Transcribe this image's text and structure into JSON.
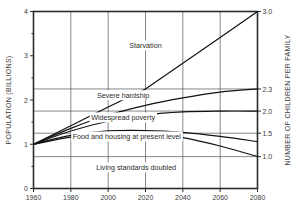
{
  "chart_data": {
    "type": "line",
    "title": "",
    "xlabel": "",
    "ylabel": "POPULATION (BILLIONS)",
    "y2label": "NUMBER OF CHILDREN PER FAMILY",
    "grid": true,
    "legend": "none (inline annotations)",
    "xlim": [
      1960,
      2080
    ],
    "ylim": [
      0,
      4
    ],
    "xticks": [
      1960,
      1980,
      2000,
      2020,
      2040,
      2060,
      2080
    ],
    "xticklabels": [
      "1960",
      "1980",
      "2000",
      "2020",
      "2040",
      "2060",
      "2080"
    ],
    "yticks": [
      0,
      1,
      2,
      3,
      4
    ],
    "yticklabels": [
      "0",
      "1",
      "2",
      "3",
      "4"
    ],
    "y2ticks": [
      3.0,
      2.3,
      2.0,
      1.5,
      1.0
    ],
    "y2ticklabels": [
      "3.0",
      "2.3",
      "2.0",
      "1.5",
      "1.0"
    ],
    "y2_population_positions": [
      4.0,
      2.25,
      1.75,
      1.25,
      0.72
    ],
    "gridline_values": [
      2.25,
      1.75,
      1.25,
      0.72
    ],
    "annotations": [
      {
        "text": "Starvation",
        "x": 2020,
        "y": 3.18
      },
      {
        "text": "Severe hardship",
        "x": 2008,
        "y": 2.05
      },
      {
        "text": "Widespread poverty",
        "x": 2008,
        "y": 1.55
      },
      {
        "text": "Food and housing at present level",
        "x": 2010,
        "y": 1.12
      },
      {
        "text": "Living standards doubled",
        "x": 2015,
        "y": 0.42
      }
    ],
    "series": [
      {
        "name": "Starvation",
        "y2_endpoint": 3.0,
        "x": [
          1960,
          1980,
          2000,
          2020,
          2040,
          2060,
          2080
        ],
        "values": [
          1.0,
          1.42,
          1.84,
          2.25,
          2.83,
          3.41,
          4.0
        ]
      },
      {
        "name": "Severe hardship",
        "y2_endpoint": 2.3,
        "x": [
          1960,
          1980,
          2000,
          2020,
          2040,
          2060,
          2080
        ],
        "values": [
          1.0,
          1.36,
          1.66,
          1.88,
          2.05,
          2.18,
          2.25
        ]
      },
      {
        "name": "Widespread poverty",
        "y2_endpoint": 2.0,
        "x": [
          1960,
          1980,
          2000,
          2020,
          2040,
          2060,
          2080
        ],
        "values": [
          1.0,
          1.3,
          1.52,
          1.66,
          1.73,
          1.75,
          1.75
        ]
      },
      {
        "name": "Food and housing at present level",
        "y2_endpoint": 1.5,
        "x": [
          1960,
          1980,
          2000,
          2020,
          2040,
          2060,
          2080
        ],
        "values": [
          1.0,
          1.2,
          1.3,
          1.31,
          1.27,
          1.18,
          1.06
        ]
      },
      {
        "name": "Living standards doubled",
        "y2_endpoint": 1.0,
        "x": [
          1960,
          1980,
          2000,
          2020,
          2040,
          2060,
          2080
        ],
        "values": [
          1.0,
          1.16,
          1.24,
          1.24,
          1.15,
          0.96,
          0.72
        ]
      }
    ]
  }
}
